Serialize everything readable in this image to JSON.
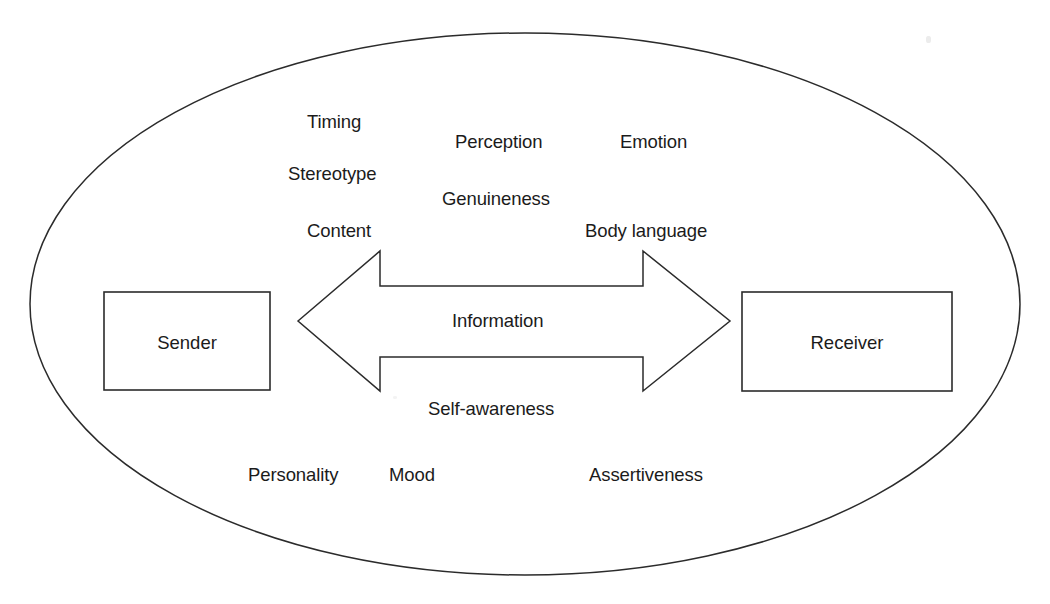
{
  "figure": {
    "background_color": "#ffffff",
    "stroke_color": "#2b2b2b",
    "text_color": "#1b1b1b"
  },
  "ellipse": {
    "name": "context-ellipse",
    "cx": 525,
    "cy": 304,
    "rx": 495,
    "ry": 271
  },
  "boxes": [
    {
      "id": "sender",
      "label": "Sender",
      "x": 104,
      "y": 292,
      "width": 166,
      "height": 98
    },
    {
      "id": "receiver",
      "label": "Receiver",
      "x": 742,
      "y": 292,
      "width": 210,
      "height": 99
    }
  ],
  "arrow": {
    "name": "double-headed-arrow",
    "label": "Information",
    "label_x": 452,
    "label_y": 311,
    "left_tip_x": 298,
    "right_tip_x": 730,
    "center_y": 321,
    "head_base_left_x": 380,
    "head_base_right_x": 643,
    "head_top_y": 251,
    "head_bottom_y": 391,
    "shaft_top_y": 286,
    "shaft_bottom_y": 357
  },
  "factor_labels": [
    {
      "id": "timing",
      "text": "Timing",
      "x": 307,
      "y": 112
    },
    {
      "id": "perception",
      "text": "Perception",
      "x": 455,
      "y": 132
    },
    {
      "id": "emotion",
      "text": "Emotion",
      "x": 620,
      "y": 132
    },
    {
      "id": "stereotype",
      "text": "Stereotype",
      "x": 288,
      "y": 164
    },
    {
      "id": "genuineness",
      "text": "Genuineness",
      "x": 442,
      "y": 189
    },
    {
      "id": "content",
      "text": "Content",
      "x": 307,
      "y": 221
    },
    {
      "id": "body-language",
      "text": "Body language",
      "x": 585,
      "y": 221
    },
    {
      "id": "self-awareness",
      "text": "Self-awareness",
      "x": 428,
      "y": 399
    },
    {
      "id": "personality",
      "text": "Personality",
      "x": 248,
      "y": 465
    },
    {
      "id": "mood",
      "text": "Mood",
      "x": 389,
      "y": 465
    },
    {
      "id": "assertiveness",
      "text": "Assertiveness",
      "x": 589,
      "y": 465
    }
  ]
}
